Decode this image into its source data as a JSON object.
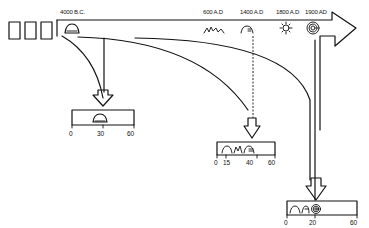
{
  "diagram": {
    "timeline": {
      "labels": [
        {
          "id": "t1",
          "text": "4000 B.C.",
          "x": 72
        },
        {
          "id": "t2",
          "text": "600 A.D",
          "x": 218
        },
        {
          "id": "t3",
          "text": "1400 A.D",
          "x": 250
        },
        {
          "id": "t4",
          "text": "1800 A.D",
          "x": 288
        },
        {
          "id": "t5",
          "text": "1900 AD",
          "x": 315
        }
      ],
      "icons": [
        {
          "id": "i1",
          "name": "dome-icon"
        },
        {
          "id": "i2",
          "name": "wave-icon"
        },
        {
          "id": "i3",
          "name": "arch-icon"
        },
        {
          "id": "i4",
          "name": "sun-burst-icon"
        },
        {
          "id": "i5",
          "name": "spiral-icon"
        }
      ],
      "blocks": 3
    },
    "scales": [
      {
        "id": "scale-1",
        "ticks": [
          "0",
          "30",
          "60"
        ]
      },
      {
        "id": "scale-2",
        "ticks": [
          "0",
          "15",
          "40",
          "60"
        ]
      },
      {
        "id": "scale-3",
        "ticks": [
          "0",
          "20",
          "60"
        ]
      }
    ],
    "colors": {
      "ink": "#111111",
      "paper": "#ffffff"
    }
  }
}
